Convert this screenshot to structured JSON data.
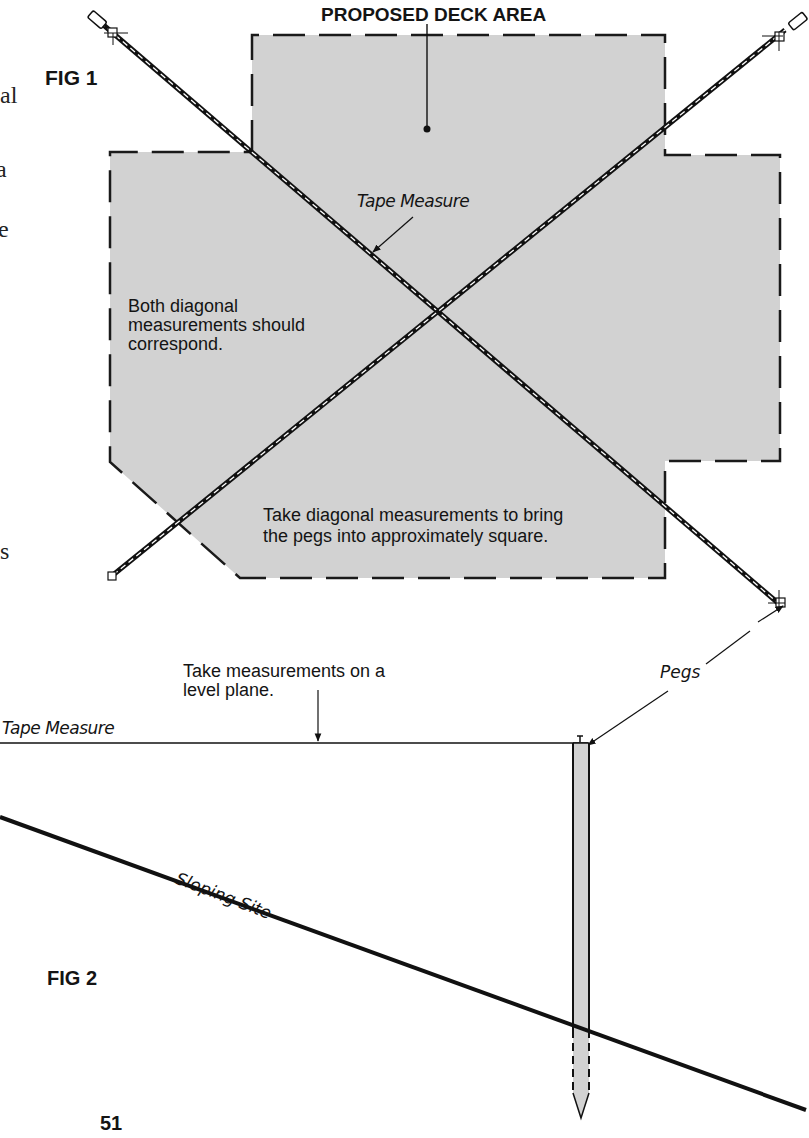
{
  "page": {
    "number": "51",
    "left_margin_fragments": [
      "al",
      "a",
      "e",
      "s"
    ]
  },
  "fig1": {
    "title": "FIG 1",
    "deck_label": "PROPOSED DECK AREA",
    "tape_label": "Tape Measure",
    "note_diagonals": [
      "Both diagonal",
      "measurements should",
      "correspond."
    ],
    "note_square": [
      "Take diagonal measurements to bring",
      "the pegs into approximately square."
    ],
    "colors": {
      "deck_fill": "#d2d2d2",
      "outline": "#1a1a1a"
    }
  },
  "fig2": {
    "title": "FIG 2",
    "tape_label": "Tape Measure",
    "level_note": [
      "Take measurements on a",
      "level plane."
    ],
    "pegs_label": "Pegs",
    "slope_label": "Sloping Site",
    "colors": {
      "peg_fill": "#d2d2d2",
      "line": "#111111"
    }
  }
}
